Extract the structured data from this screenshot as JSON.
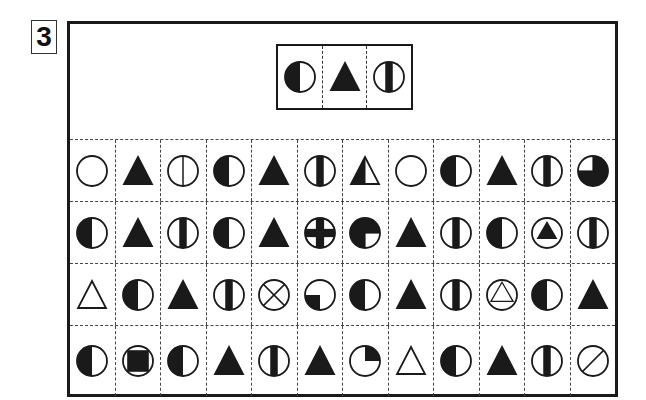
{
  "question": {
    "number": "3"
  },
  "target_sequence": [
    {
      "symbol": "circle-left-half-filled"
    },
    {
      "symbol": "triangle-filled"
    },
    {
      "symbol": "circle-center-stripe"
    }
  ],
  "grid": {
    "rows": 4,
    "columns": 12,
    "cells": [
      [
        "circle-empty",
        "triangle-filled",
        "circle-vertical-line",
        "circle-left-half-filled",
        "triangle-filled",
        "circle-center-stripe",
        "triangle-left-half-filled",
        "circle-empty",
        "circle-left-half-filled",
        "triangle-filled",
        "circle-center-stripe",
        "circle-three-quarter-filled"
      ],
      [
        "circle-left-half-filled",
        "triangle-filled",
        "circle-center-stripe",
        "circle-left-half-filled",
        "triangle-filled",
        "circle-cross-filled",
        "circle-three-quarter-filled-br-empty",
        "triangle-filled",
        "circle-center-stripe",
        "circle-left-half-filled",
        "circle-with-filled-triangle",
        "circle-center-stripe"
      ],
      [
        "triangle-empty",
        "circle-left-half-filled",
        "triangle-filled",
        "circle-center-stripe",
        "circle-x",
        "circle-quarter-bl-filled",
        "circle-left-half-filled",
        "triangle-filled",
        "circle-center-stripe",
        "circle-with-empty-triangle",
        "circle-left-half-filled",
        "triangle-filled"
      ],
      [
        "circle-left-half-filled",
        "circle-with-filled-square",
        "circle-left-half-filled",
        "triangle-filled",
        "circle-center-stripe",
        "triangle-filled",
        "circle-quarter-tr-filled",
        "triangle-empty",
        "circle-left-half-filled",
        "triangle-filled",
        "circle-center-stripe",
        "circle-slash"
      ]
    ]
  },
  "colors": {
    "ink": "#1a1a1a",
    "paper": "#ffffff"
  }
}
